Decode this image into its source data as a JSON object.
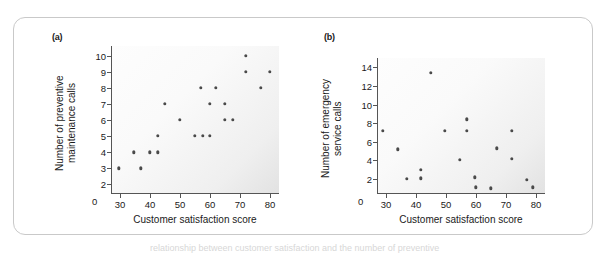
{
  "figure": {
    "panel_a_label": "(a)",
    "panel_b_label": "(b)",
    "caption_fragment": "relationship between customer satisfaction and the number of preventive"
  },
  "chart_data": [
    {
      "type": "scatter",
      "panel": "(a)",
      "title": "",
      "xlabel": "Customer satisfaction score",
      "ylabel": "Number of preventive maintenance calls",
      "ylabel_lines": [
        "Number of preventive",
        "maintenance calls"
      ],
      "xlim": [
        27,
        83
      ],
      "ylim": [
        1.4,
        10.6
      ],
      "x_ticks": [
        30,
        40,
        50,
        60,
        70,
        80
      ],
      "y_ticks": [
        2,
        3,
        4,
        5,
        6,
        7,
        8,
        9,
        10
      ],
      "x_axis_origin_label": "0",
      "y_axis_origin_label": "0",
      "grid": false,
      "legend": "none",
      "marker_color": "#4a4a4a",
      "points": [
        {
          "x": 29.5,
          "y": 3
        },
        {
          "x": 34.5,
          "y": 4
        },
        {
          "x": 37,
          "y": 3
        },
        {
          "x": 40,
          "y": 4
        },
        {
          "x": 42.5,
          "y": 4
        },
        {
          "x": 42.5,
          "y": 5
        },
        {
          "x": 45,
          "y": 7
        },
        {
          "x": 50,
          "y": 6
        },
        {
          "x": 55,
          "y": 5
        },
        {
          "x": 57,
          "y": 8
        },
        {
          "x": 57.5,
          "y": 5
        },
        {
          "x": 60,
          "y": 5
        },
        {
          "x": 60,
          "y": 7
        },
        {
          "x": 62,
          "y": 8
        },
        {
          "x": 65,
          "y": 7
        },
        {
          "x": 65,
          "y": 6
        },
        {
          "x": 67.5,
          "y": 6
        },
        {
          "x": 72,
          "y": 10
        },
        {
          "x": 72,
          "y": 9
        },
        {
          "x": 77,
          "y": 8
        },
        {
          "x": 80,
          "y": 9
        }
      ]
    },
    {
      "type": "scatter",
      "panel": "(b)",
      "title": "",
      "xlabel": "Customer satisfaction score",
      "ylabel": "Number of emergency service calls",
      "ylabel_lines": [
        "Number of emergency",
        "service calls"
      ],
      "xlim": [
        27,
        83
      ],
      "ylim": [
        0.4,
        15.0
      ],
      "x_ticks": [
        30,
        40,
        50,
        60,
        70,
        80
      ],
      "y_ticks": [
        2,
        4,
        6,
        8,
        10,
        12,
        14
      ],
      "x_axis_origin_label": "0",
      "y_axis_origin_label": "0",
      "grid": false,
      "legend": "none",
      "marker_color": "#4a4a4a",
      "points": [
        {
          "x": 29,
          "y": 7.2
        },
        {
          "x": 34,
          "y": 5.2
        },
        {
          "x": 37,
          "y": 2.0
        },
        {
          "x": 41.5,
          "y": 3.0
        },
        {
          "x": 41.5,
          "y": 2.1
        },
        {
          "x": 45,
          "y": 13.4
        },
        {
          "x": 49.5,
          "y": 7.2
        },
        {
          "x": 54.5,
          "y": 4.1
        },
        {
          "x": 57,
          "y": 8.4
        },
        {
          "x": 57,
          "y": 7.2
        },
        {
          "x": 59.5,
          "y": 2.2
        },
        {
          "x": 60,
          "y": 1.1
        },
        {
          "x": 65,
          "y": 1.0
        },
        {
          "x": 67,
          "y": 5.3
        },
        {
          "x": 72,
          "y": 7.2
        },
        {
          "x": 72,
          "y": 4.2
        },
        {
          "x": 77,
          "y": 1.9
        },
        {
          "x": 79,
          "y": 1.1
        }
      ]
    }
  ]
}
